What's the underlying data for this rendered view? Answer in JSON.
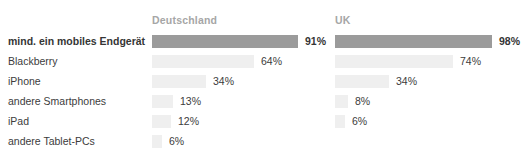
{
  "chart_data": {
    "type": "bar",
    "orientation": "horizontal",
    "title": "",
    "categories": [
      "mind. ein mobiles Endgerät",
      "Blackberry",
      "iPhone",
      "andere Smartphones",
      "iPad",
      "andere Tablet-PCs"
    ],
    "series": [
      {
        "name": "Deutschland",
        "values": [
          91,
          64,
          34,
          13,
          12,
          6
        ]
      },
      {
        "name": "UK",
        "values": [
          98,
          74,
          34,
          8,
          6,
          null
        ]
      }
    ],
    "value_suffix": "%",
    "xlim": [
      0,
      100
    ],
    "grid": false,
    "legend_position": "top-column-headers",
    "highlighted_category": "mind. ein mobiles Endgerät"
  },
  "colors": {
    "bar_highlight": "#9b9b9b",
    "bar_default": "#efefef",
    "header_text": "#a6a6a6",
    "label_text": "#3c3c3c"
  }
}
